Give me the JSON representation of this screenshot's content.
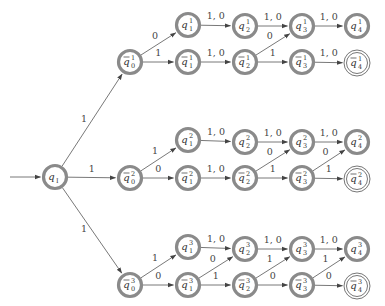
{
  "diagram": {
    "type": "finite-automaton",
    "colors": {
      "state_ring": "#8a8a8a",
      "edge": "#555555",
      "text": "#333333"
    },
    "initial_state": "qI",
    "states": [
      {
        "id": "qI",
        "base": "q",
        "bar": false,
        "sub": "I",
        "sup": "",
        "x": 55,
        "y": 177,
        "accept": false
      },
      {
        "id": "qb0_1",
        "base": "q",
        "bar": true,
        "sub": "0",
        "sup": "1",
        "x": 130,
        "y": 62,
        "accept": false
      },
      {
        "id": "q1_1",
        "base": "q",
        "bar": false,
        "sub": "1",
        "sup": "1",
        "x": 188,
        "y": 25,
        "accept": false
      },
      {
        "id": "qb1_1",
        "base": "q",
        "bar": true,
        "sub": "1",
        "sup": "1",
        "x": 188,
        "y": 62,
        "accept": false
      },
      {
        "id": "q2_1",
        "base": "q",
        "bar": false,
        "sub": "2",
        "sup": "1",
        "x": 245,
        "y": 26,
        "accept": false
      },
      {
        "id": "qb2_1",
        "base": "q",
        "bar": true,
        "sub": "2",
        "sup": "1",
        "x": 245,
        "y": 62,
        "accept": false
      },
      {
        "id": "q3_1",
        "base": "q",
        "bar": false,
        "sub": "3",
        "sup": "1",
        "x": 302,
        "y": 26,
        "accept": false
      },
      {
        "id": "qb3_1",
        "base": "q",
        "bar": true,
        "sub": "3",
        "sup": "1",
        "x": 302,
        "y": 62,
        "accept": false
      },
      {
        "id": "q4_1",
        "base": "q",
        "bar": false,
        "sub": "4",
        "sup": "1",
        "x": 357,
        "y": 26,
        "accept": false
      },
      {
        "id": "qb4_1",
        "base": "q",
        "bar": true,
        "sub": "4",
        "sup": "1",
        "x": 357,
        "y": 63,
        "accept": true
      },
      {
        "id": "qb0_2",
        "base": "q",
        "bar": true,
        "sub": "0",
        "sup": "2",
        "x": 130,
        "y": 178,
        "accept": false
      },
      {
        "id": "q1_2",
        "base": "q",
        "bar": false,
        "sub": "1",
        "sup": "2",
        "x": 188,
        "y": 140,
        "accept": false
      },
      {
        "id": "qb1_2",
        "base": "q",
        "bar": true,
        "sub": "1",
        "sup": "2",
        "x": 188,
        "y": 178,
        "accept": false
      },
      {
        "id": "q2_2",
        "base": "q",
        "bar": false,
        "sub": "2",
        "sup": "2",
        "x": 245,
        "y": 142,
        "accept": false
      },
      {
        "id": "qb2_2",
        "base": "q",
        "bar": true,
        "sub": "2",
        "sup": "2",
        "x": 245,
        "y": 178,
        "accept": false
      },
      {
        "id": "q3_2",
        "base": "q",
        "bar": false,
        "sub": "3",
        "sup": "2",
        "x": 302,
        "y": 142,
        "accept": false
      },
      {
        "id": "qb3_2",
        "base": "q",
        "bar": true,
        "sub": "3",
        "sup": "2",
        "x": 302,
        "y": 178,
        "accept": false
      },
      {
        "id": "q4_2",
        "base": "q",
        "bar": false,
        "sub": "4",
        "sup": "2",
        "x": 357,
        "y": 142,
        "accept": false
      },
      {
        "id": "qb4_2",
        "base": "q",
        "bar": true,
        "sub": "4",
        "sup": "2",
        "x": 357,
        "y": 179,
        "accept": true
      },
      {
        "id": "qb0_3",
        "base": "q",
        "bar": true,
        "sub": "0",
        "sup": "3",
        "x": 130,
        "y": 285,
        "accept": false
      },
      {
        "id": "q1_3",
        "base": "q",
        "bar": false,
        "sub": "1",
        "sup": "3",
        "x": 188,
        "y": 247,
        "accept": false
      },
      {
        "id": "qb1_3",
        "base": "q",
        "bar": true,
        "sub": "1",
        "sup": "3",
        "x": 188,
        "y": 285,
        "accept": false
      },
      {
        "id": "q2_3",
        "base": "q",
        "bar": false,
        "sub": "2",
        "sup": "3",
        "x": 245,
        "y": 249,
        "accept": false
      },
      {
        "id": "qb2_3",
        "base": "q",
        "bar": true,
        "sub": "2",
        "sup": "3",
        "x": 245,
        "y": 285,
        "accept": false
      },
      {
        "id": "q3_3",
        "base": "q",
        "bar": false,
        "sub": "3",
        "sup": "3",
        "x": 302,
        "y": 249,
        "accept": false
      },
      {
        "id": "qb3_3",
        "base": "q",
        "bar": true,
        "sub": "3",
        "sup": "3",
        "x": 302,
        "y": 285,
        "accept": false
      },
      {
        "id": "q4_3",
        "base": "q",
        "bar": false,
        "sub": "4",
        "sup": "3",
        "x": 357,
        "y": 249,
        "accept": false
      },
      {
        "id": "qb4_3",
        "base": "q",
        "bar": true,
        "sub": "4",
        "sup": "3",
        "x": 357,
        "y": 286,
        "accept": true
      }
    ],
    "transitions": [
      {
        "from": "start",
        "to": "qI",
        "label": ""
      },
      {
        "from": "qI",
        "to": "qb0_1",
        "label": "1"
      },
      {
        "from": "qI",
        "to": "qb0_2",
        "label": "1"
      },
      {
        "from": "qI",
        "to": "qb0_3",
        "label": "1"
      },
      {
        "from": "qb0_1",
        "to": "q1_1",
        "label": "0"
      },
      {
        "from": "qb0_1",
        "to": "qb1_1",
        "label": "1"
      },
      {
        "from": "q1_1",
        "to": "q2_1",
        "label": "1, 0"
      },
      {
        "from": "qb1_1",
        "to": "qb2_1",
        "label": "1, 0"
      },
      {
        "from": "q2_1",
        "to": "q3_1",
        "label": "1, 0"
      },
      {
        "from": "qb2_1",
        "to": "q3_1",
        "label": "0"
      },
      {
        "from": "qb2_1",
        "to": "qb3_1",
        "label": "1"
      },
      {
        "from": "q3_1",
        "to": "q4_1",
        "label": "1, 0"
      },
      {
        "from": "qb3_1",
        "to": "qb4_1",
        "label": "1, 0"
      },
      {
        "from": "qb0_2",
        "to": "q1_2",
        "label": "1"
      },
      {
        "from": "qb0_2",
        "to": "qb1_2",
        "label": "0"
      },
      {
        "from": "q1_2",
        "to": "q2_2",
        "label": "1, 0"
      },
      {
        "from": "qb1_2",
        "to": "qb2_2",
        "label": "1, 0"
      },
      {
        "from": "q2_2",
        "to": "q3_2",
        "label": "1, 0"
      },
      {
        "from": "qb2_2",
        "to": "q3_2",
        "label": "0"
      },
      {
        "from": "qb2_2",
        "to": "qb3_2",
        "label": "1"
      },
      {
        "from": "q3_2",
        "to": "q4_2",
        "label": "1, 0"
      },
      {
        "from": "qb3_2",
        "to": "q4_2",
        "label": "0"
      },
      {
        "from": "qb3_2",
        "to": "qb4_2",
        "label": "1"
      },
      {
        "from": "qb0_3",
        "to": "q1_3",
        "label": "1"
      },
      {
        "from": "qb0_3",
        "to": "qb1_3",
        "label": "0"
      },
      {
        "from": "q1_3",
        "to": "q2_3",
        "label": "1, 0"
      },
      {
        "from": "qb1_3",
        "to": "q2_3",
        "label": "0"
      },
      {
        "from": "qb1_3",
        "to": "qb2_3",
        "label": "1"
      },
      {
        "from": "q2_3",
        "to": "q3_3",
        "label": "1, 0"
      },
      {
        "from": "qb2_3",
        "to": "q3_3",
        "label": "1"
      },
      {
        "from": "qb2_3",
        "to": "qb3_3",
        "label": "0"
      },
      {
        "from": "q3_3",
        "to": "q4_3",
        "label": "1, 0"
      },
      {
        "from": "qb3_3",
        "to": "q4_3",
        "label": "1"
      },
      {
        "from": "qb3_3",
        "to": "qb4_3",
        "label": "0"
      }
    ]
  }
}
